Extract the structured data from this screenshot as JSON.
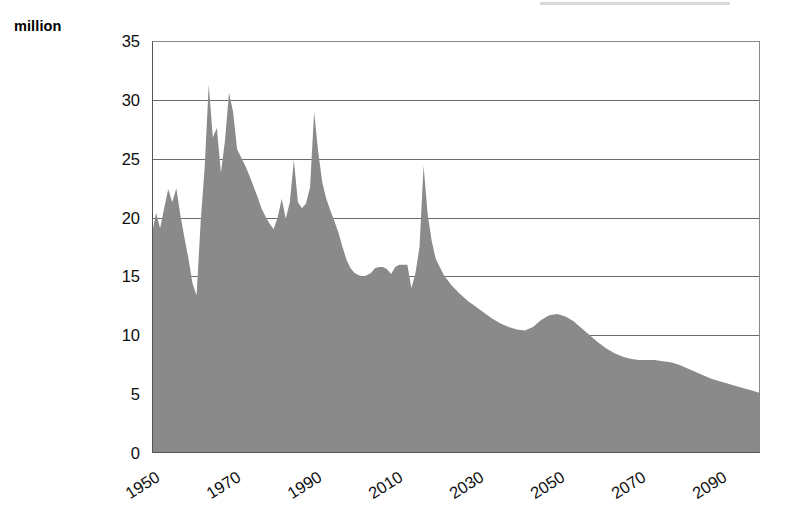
{
  "figure": {
    "width": 785,
    "height": 526,
    "background": "#ffffff",
    "y_unit_label": "million",
    "area_fill_color": "#8a8a8a",
    "gridline_color": "#6d6d6d",
    "axis_color": "#555555",
    "tick_text_color": "#0d0d0d"
  },
  "axes": {
    "y": {
      "ticks": [
        "0",
        "5",
        "10",
        "15",
        "20",
        "25",
        "30",
        "35"
      ],
      "min": 0,
      "max": 35,
      "step": 5,
      "grid": true
    },
    "x": {
      "ticks": [
        "1950",
        "1970",
        "1990",
        "2010",
        "2030",
        "2050",
        "2070",
        "2090"
      ],
      "tick_values": [
        1950,
        1970,
        1990,
        2010,
        2030,
        2050,
        2070,
        2090
      ],
      "min": 1950,
      "max": 2100,
      "rotation_degrees": -32,
      "grid": false
    }
  },
  "chart_data": {
    "type": "area",
    "title": "",
    "subtitle": "",
    "xlabel": "",
    "ylabel": "million",
    "xlim": [
      1950,
      2100
    ],
    "ylim": [
      0,
      35
    ],
    "grid": true,
    "legend": [],
    "annotations": [],
    "series": [
      {
        "name": "million",
        "fill": "#8a8a8a",
        "x": [
          1950,
          1951,
          1952,
          1953,
          1954,
          1955,
          1956,
          1957,
          1958,
          1959,
          1960,
          1961,
          1962,
          1963,
          1964,
          1965,
          1966,
          1967,
          1968,
          1969,
          1970,
          1971,
          1972,
          1973,
          1974,
          1975,
          1976,
          1977,
          1978,
          1979,
          1980,
          1981,
          1982,
          1983,
          1984,
          1985,
          1986,
          1987,
          1988,
          1989,
          1990,
          1991,
          1992,
          1993,
          1994,
          1995,
          1996,
          1997,
          1998,
          1999,
          2000,
          2001,
          2002,
          2003,
          2004,
          2005,
          2006,
          2007,
          2008,
          2009,
          2010,
          2011,
          2012,
          2013,
          2014,
          2015,
          2016,
          2017,
          2018,
          2019,
          2020,
          2022,
          2024,
          2026,
          2028,
          2030,
          2032,
          2034,
          2036,
          2038,
          2040,
          2042,
          2044,
          2046,
          2048,
          2050,
          2052,
          2054,
          2056,
          2058,
          2060,
          2062,
          2064,
          2066,
          2068,
          2070,
          2072,
          2074,
          2076,
          2078,
          2080,
          2082,
          2084,
          2086,
          2088,
          2090,
          2092,
          2094,
          2096,
          2098,
          2100
        ],
        "y": [
          18.6,
          20.4,
          19.1,
          20.8,
          22.4,
          21.3,
          22.5,
          20.2,
          18.3,
          16.5,
          14.4,
          13.4,
          19.6,
          24.3,
          31.3,
          26.8,
          27.6,
          23.8,
          26.5,
          30.6,
          29.0,
          25.8,
          25.1,
          24.4,
          23.6,
          22.7,
          21.8,
          20.8,
          20.1,
          19.5,
          19.0,
          20.0,
          21.6,
          19.9,
          21.3,
          24.9,
          21.3,
          20.8,
          21.2,
          22.6,
          29.0,
          25.6,
          23.0,
          21.6,
          20.6,
          19.7,
          18.7,
          17.5,
          16.4,
          15.7,
          15.3,
          15.1,
          15.0,
          15.1,
          15.3,
          15.7,
          15.8,
          15.8,
          15.6,
          15.2,
          15.8,
          16.0,
          16.0,
          16.0,
          14.0,
          15.3,
          17.5,
          24.4,
          20.3,
          18.0,
          16.5,
          15.1,
          14.2,
          13.5,
          12.9,
          12.4,
          11.9,
          11.4,
          11.0,
          10.7,
          10.5,
          10.4,
          10.7,
          11.3,
          11.7,
          11.8,
          11.6,
          11.2,
          10.6,
          10.0,
          9.4,
          8.9,
          8.5,
          8.2,
          8.0,
          7.9,
          7.9,
          7.9,
          7.8,
          7.7,
          7.5,
          7.2,
          6.9,
          6.6,
          6.3,
          6.1,
          5.9,
          5.7,
          5.5,
          5.3,
          5.1
        ]
      }
    ]
  }
}
